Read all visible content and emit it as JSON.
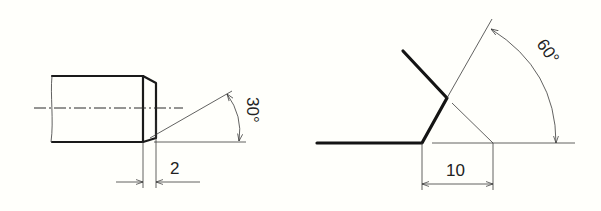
{
  "figures": [
    {
      "name": "shaft-chamfer",
      "description": "Shaft end with chamfer",
      "dimensions": {
        "chamfer_length": "2",
        "chamfer_angle": "30°"
      }
    },
    {
      "name": "weld-groove",
      "description": "Bevel groove with angle and width",
      "dimensions": {
        "groove_width": "10",
        "groove_angle": "60°"
      }
    }
  ],
  "colors": {
    "background": "#fffffb",
    "line": "#1a1a1a"
  }
}
